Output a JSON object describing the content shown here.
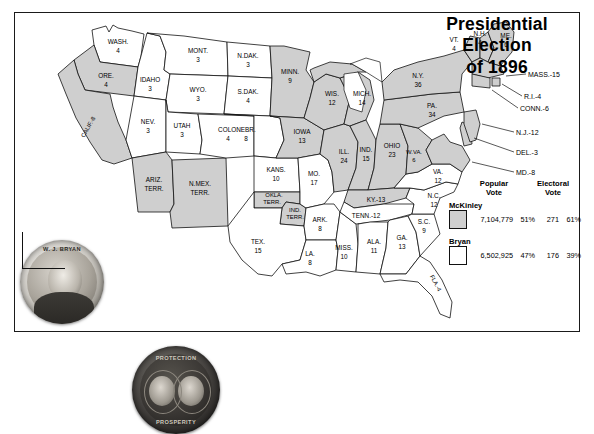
{
  "title": {
    "line1": "Presidential",
    "line2": "Election",
    "line3": "of 1896"
  },
  "legend": {
    "mckinley_color": "#cfcfcf",
    "bryan_color": "#ffffff",
    "territory_color": "#cfcfcf"
  },
  "results": {
    "headers": {
      "popular": "Popular\nVote",
      "popular_l1": "Popular",
      "popular_l2": "Vote",
      "electoral_l1": "Electoral",
      "electoral_l2": "Vote"
    },
    "rows": [
      {
        "candidate": "McKinley",
        "popular_vote": "7,104,779",
        "popular_pct": "51%",
        "electoral_vote": "271",
        "electoral_pct": "61%",
        "swatch": "#cfcfcf"
      },
      {
        "candidate": "Bryan",
        "popular_vote": "6,502,925",
        "popular_pct": "47%",
        "electoral_vote": "176",
        "electoral_pct": "39%",
        "swatch": "#ffffff"
      }
    ]
  },
  "buttons": [
    {
      "name": "bryan-campaign-button",
      "text": "W. J. BRYAN",
      "caption": ""
    },
    {
      "name": "mckinley-hobart-campaign-button",
      "text_top": "PROTECTION",
      "text_bottom": "PROSPERITY"
    }
  ],
  "states": [
    {
      "abbr": "WASH.",
      "votes": "4",
      "winner": "bryan"
    },
    {
      "abbr": "ORE.",
      "votes": "4",
      "winner": "mckinley"
    },
    {
      "abbr": "CALIF.",
      "votes": "8",
      "winner": "mckinley",
      "label": "CALIF.-8"
    },
    {
      "abbr": "IDAHO",
      "votes": "3",
      "winner": "bryan"
    },
    {
      "abbr": "NEV.",
      "votes": "3",
      "winner": "bryan"
    },
    {
      "abbr": "MONT.",
      "votes": "3",
      "winner": "bryan"
    },
    {
      "abbr": "WYO.",
      "votes": "3",
      "winner": "bryan"
    },
    {
      "abbr": "UTAH",
      "votes": "3",
      "winner": "bryan"
    },
    {
      "abbr": "ARIZ. TERR.",
      "votes": "",
      "winner": "territory"
    },
    {
      "abbr": "N.MEX. TERR.",
      "votes": "",
      "winner": "territory"
    },
    {
      "abbr": "COLO.",
      "votes": "4",
      "winner": "bryan"
    },
    {
      "abbr": "N.DAK.",
      "votes": "3",
      "winner": "bryan"
    },
    {
      "abbr": "S.DAK.",
      "votes": "4",
      "winner": "bryan"
    },
    {
      "abbr": "NEBR.",
      "votes": "8",
      "winner": "bryan"
    },
    {
      "abbr": "KANS.",
      "votes": "10",
      "winner": "bryan"
    },
    {
      "abbr": "OKLA. TERR.",
      "votes": "",
      "winner": "territory"
    },
    {
      "abbr": "IND. TERR.",
      "votes": "",
      "winner": "territory"
    },
    {
      "abbr": "TEX.",
      "votes": "15",
      "winner": "bryan"
    },
    {
      "abbr": "MINN.",
      "votes": "9",
      "winner": "mckinley"
    },
    {
      "abbr": "IOWA",
      "votes": "13",
      "winner": "mckinley"
    },
    {
      "abbr": "MO.",
      "votes": "17",
      "winner": "bryan"
    },
    {
      "abbr": "ARK.",
      "votes": "8",
      "winner": "bryan"
    },
    {
      "abbr": "LA.",
      "votes": "8",
      "winner": "bryan"
    },
    {
      "abbr": "MISS.",
      "votes": "10",
      "winner": "bryan"
    },
    {
      "abbr": "WIS.",
      "votes": "12",
      "winner": "mckinley"
    },
    {
      "abbr": "ILL.",
      "votes": "24",
      "winner": "mckinley"
    },
    {
      "abbr": "MICH.",
      "votes": "14",
      "winner": "mckinley"
    },
    {
      "abbr": "IND.",
      "votes": "15",
      "winner": "mckinley"
    },
    {
      "abbr": "OHIO",
      "votes": "23",
      "winner": "mckinley"
    },
    {
      "abbr": "KY.",
      "votes": "13",
      "winner": "mckinley",
      "label": "KY.-13"
    },
    {
      "abbr": "TENN.",
      "votes": "12",
      "winner": "bryan",
      "label": "TENN.-12"
    },
    {
      "abbr": "ALA.",
      "votes": "11",
      "winner": "bryan"
    },
    {
      "abbr": "GA.",
      "votes": "13",
      "winner": "bryan"
    },
    {
      "abbr": "S.C.",
      "votes": "9",
      "winner": "bryan"
    },
    {
      "abbr": "FLA.",
      "votes": "4",
      "winner": "bryan",
      "label": "FLA.-4"
    },
    {
      "abbr": "N.C.",
      "votes": "12",
      "winner": "bryan"
    },
    {
      "abbr": "VA.",
      "votes": "12",
      "winner": "bryan"
    },
    {
      "abbr": "W.VA.",
      "votes": "6",
      "winner": "mckinley"
    },
    {
      "abbr": "PA.",
      "votes": "34",
      "winner": "mckinley"
    },
    {
      "abbr": "N.Y.",
      "votes": "36",
      "winner": "mckinley"
    },
    {
      "abbr": "VT.",
      "votes": "4",
      "winner": "mckinley"
    },
    {
      "abbr": "N.H.",
      "votes": "4",
      "winner": "mckinley"
    },
    {
      "abbr": "ME.",
      "votes": "6",
      "winner": "mckinley"
    }
  ],
  "leader_labels": [
    {
      "abbr": "MASS.",
      "votes": "15",
      "label": "MASS.-15",
      "winner": "mckinley"
    },
    {
      "abbr": "R.I.",
      "votes": "4",
      "label": "R.I.-4",
      "winner": "mckinley"
    },
    {
      "abbr": "CONN.",
      "votes": "6",
      "label": "CONN.-6",
      "winner": "mckinley"
    },
    {
      "abbr": "N.J.",
      "votes": "12",
      "label": "N.J.-12",
      "winner": "mckinley"
    },
    {
      "abbr": "DEL.",
      "votes": "3",
      "label": "DEL.-3",
      "winner": "mckinley"
    },
    {
      "abbr": "MD.",
      "votes": "8",
      "label": "MD.-8",
      "winner": "mckinley"
    }
  ],
  "map_labels": {
    "wash": "WASH.",
    "wash_v": "4",
    "ore": "ORE.",
    "ore_v": "4",
    "calif": "CALIF.-8",
    "idaho": "IDAHO",
    "idaho_v": "3",
    "nev": "NEV.",
    "nev_v": "3",
    "mont": "MONT.",
    "mont_v": "3",
    "wyo": "WYO.",
    "wyo_v": "3",
    "utah": "UTAH",
    "utah_v": "3",
    "ariz1": "ARIZ.",
    "ariz2": "TERR.",
    "nmex1": "N.MEX.",
    "nmex2": "TERR.",
    "colo": "COLO.",
    "colo_v": "4",
    "ndak": "N.DAK.",
    "ndak_v": "3",
    "sdak": "S.DAK.",
    "sdak_v": "4",
    "nebr": "NEBR.",
    "nebr_v": "8",
    "kans": "KANS.",
    "kans_v": "10",
    "okla1": "OKLA.",
    "okla2": "TERR.",
    "indt1": "IND.",
    "indt2": "TERR.",
    "tex": "TEX.",
    "tex_v": "15",
    "minn": "MINN.",
    "minn_v": "9",
    "iowa": "IOWA",
    "iowa_v": "13",
    "mo": "MO.",
    "mo_v": "17",
    "ark": "ARK.",
    "ark_v": "8",
    "la": "LA.",
    "la_v": "8",
    "miss": "MISS.",
    "miss_v": "10",
    "wis": "WIS.",
    "wis_v": "12",
    "ill": "ILL.",
    "ill_v": "24",
    "mich": "MICH.",
    "mich_v": "14",
    "ind": "IND.",
    "ind_v": "15",
    "ohio": "OHIO",
    "ohio_v": "23",
    "ky": "KY.-13",
    "tenn": "TENN.-12",
    "ala": "ALA.",
    "ala_v": "11",
    "ga": "GA.",
    "ga_v": "13",
    "sc": "S.C.",
    "sc_v": "9",
    "fla": "FLA.-4",
    "nc": "N.C.",
    "nc_v": "12",
    "va": "VA.",
    "va_v": "12",
    "wva": "W.VA.",
    "wva_v": "6",
    "pa": "PA.",
    "pa_v": "34",
    "ny": "N.Y.",
    "ny_v": "36",
    "vt": "VT.",
    "vt_v": "4",
    "nh": "N.H.",
    "nh_v": "4",
    "me": "ME.",
    "me_v": "6",
    "mass": "MASS.-15",
    "ri": "R.I.-4",
    "conn": "CONN.-6",
    "nj": "N.J.-12",
    "del": "DEL.-3",
    "md": "MD.-8"
  }
}
